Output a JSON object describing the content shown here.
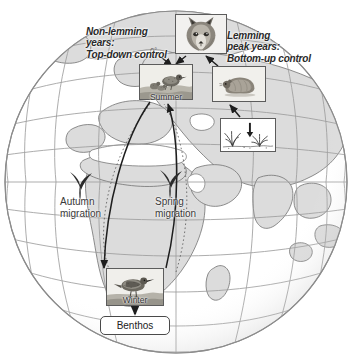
{
  "figure": {
    "type": "conceptual-ecology-diagram",
    "base_map": "globe-orthographic-europe-africa-asia",
    "background_color": "#ffffff"
  },
  "globe": {
    "center_x": 176,
    "center_y": 182,
    "radius": 172,
    "ocean_color": "#ffffff",
    "land_color": "#dcdcdc",
    "land_outline_color": "#7a7a7a",
    "graticule_color": "#9a9a9a",
    "limb_color": "#8c8c8c",
    "graticule_spacing_degrees": 15
  },
  "annotations": {
    "non_lemming": "Non-lemming\nyears:\nTop-down control",
    "non_lemming_lines": [
      "Non-lemming",
      "years:",
      "Top-down control"
    ],
    "lemming": "Lemming\npeak years:\nBottom-up control",
    "lemming_lines": [
      "Lemming",
      "peak years:",
      "Bottom-up control"
    ],
    "autumn_migration_lines": [
      "Autumn",
      "migration"
    ],
    "spring_migration_lines": [
      "Spring",
      "migration"
    ],
    "degree_tick": "0°"
  },
  "boxes": {
    "fox": {
      "caption": "",
      "subject": "arctic-fox-face-photo"
    },
    "summer": {
      "caption": "Summer",
      "subject": "shorebird-nest-chicks-photo"
    },
    "lemming": {
      "caption": "",
      "subject": "lemming-rodent-photo"
    },
    "plants": {
      "caption": "",
      "subject": "tundra-vegetation-sketch"
    },
    "winter": {
      "caption": "Winter",
      "subject": "shorebird-foraging-photo"
    },
    "benthos": {
      "caption": "Benthos",
      "subject": "benthic-prey-label"
    }
  },
  "birds": [
    {
      "name": "autumn-migration-bird",
      "x": 78,
      "y": 178
    },
    {
      "name": "spring-migration-bird",
      "x": 168,
      "y": 176
    }
  ],
  "arrows": [
    {
      "name": "top-down-control-arrow",
      "from": "non-lemming-label",
      "to": "summer-box"
    },
    {
      "name": "fox-to-summer-arrow",
      "from": "fox-box",
      "to": "summer-box"
    },
    {
      "name": "lemming-to-fox-arrow",
      "from": "lemming-box",
      "to": "fox-box"
    },
    {
      "name": "plants-to-lemming-arrow",
      "from": "plants-box",
      "to": "lemming-box"
    },
    {
      "name": "autumn-migration-arrow",
      "from": "summer-box",
      "to": "winter-box"
    },
    {
      "name": "winter-to-benthos-arrow",
      "from": "winter-box",
      "to": "benthos-box"
    },
    {
      "name": "spring-migration-arrow",
      "from": "winter-box",
      "to": "summer-box"
    }
  ],
  "migration_paths": [
    {
      "name": "autumn-migration-path",
      "style": "dotted"
    },
    {
      "name": "spring-migration-path",
      "style": "dotted"
    }
  ],
  "colors": {
    "ink": "#2a2a2a",
    "box_border": "#5c5c5c",
    "arrow": "#1e1e1e",
    "land": "#dcdcdc",
    "graticule": "#9a9a9a"
  }
}
